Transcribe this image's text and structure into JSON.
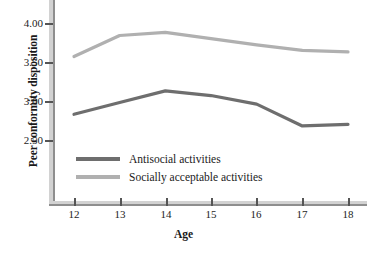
{
  "chart_data": {
    "type": "line",
    "title": "",
    "xlabel": "Age",
    "ylabel": "Peer conformity disposition",
    "x": [
      12,
      13,
      14,
      15,
      16,
      17,
      18
    ],
    "xticklabels": [
      "12",
      "13",
      "14",
      "15",
      "16",
      "17",
      "18"
    ],
    "yticks": [
      4.0,
      3.5,
      3.0,
      2.5
    ],
    "yticklabels": [
      "4.00",
      "3.50",
      "3.00",
      "2.50"
    ],
    "xlim": [
      11.5,
      18.5
    ],
    "ylim": [
      2.2,
      4.15
    ],
    "grid": false,
    "legend_position": "inside-lower-left",
    "series": [
      {
        "name": "Antisocial activities",
        "color": "#6e6e6e",
        "values": [
          2.83,
          2.98,
          3.13,
          3.07,
          2.96,
          2.68,
          2.7
        ]
      },
      {
        "name": "Socially acceptable activities",
        "color": "#b0b0b0",
        "values": [
          3.57,
          3.84,
          3.88,
          3.8,
          3.72,
          3.65,
          3.63
        ]
      }
    ]
  },
  "axes": {
    "y_label": "Peer conformity disposition",
    "x_label": "Age",
    "y_tick_labels": [
      "4.00",
      "3.50",
      "3.00",
      "2.50"
    ],
    "x_tick_labels": [
      "12",
      "13",
      "14",
      "15",
      "16",
      "17",
      "18"
    ]
  },
  "legend": {
    "entries": [
      {
        "label": "Antisocial activities",
        "color": "#6e6e6e"
      },
      {
        "label": "Socially acceptable activities",
        "color": "#b0b0b0"
      }
    ]
  },
  "colors": {
    "antisocial_line": "#6e6e6e",
    "socially_acceptable_line": "#b0b0b0",
    "spine": "#d2d2d2",
    "text": "#1a1a1a",
    "background": "#ffffff"
  }
}
